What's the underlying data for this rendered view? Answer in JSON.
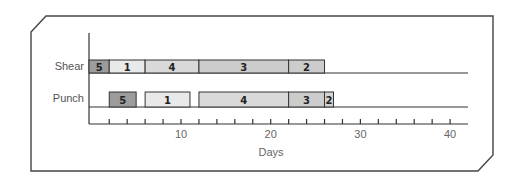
{
  "chart_data": {
    "type": "bar",
    "subtype": "gantt",
    "title": "",
    "xlabel": "Days",
    "ylabel": "",
    "xlim": [
      0,
      42
    ],
    "x_ticks_major": [
      10,
      20,
      30,
      40
    ],
    "x_tick_labels": [
      "10",
      "20",
      "30",
      "40"
    ],
    "x_minor_tick_step": 2,
    "grid": false,
    "legend": null,
    "categories": [
      "Shear",
      "Punch"
    ],
    "series": [
      {
        "name": "Shear",
        "segments": [
          {
            "label": "5",
            "start": 0,
            "end": 2,
            "color": "#9c9c9c"
          },
          {
            "label": "1",
            "start": 2,
            "end": 6,
            "color": "#e9e9e9"
          },
          {
            "label": "4",
            "start": 6,
            "end": 12,
            "color": "#d9d9d9"
          },
          {
            "label": "3",
            "start": 12,
            "end": 22,
            "color": "#cccccc"
          },
          {
            "label": "2",
            "start": 22,
            "end": 26,
            "color": "#cccccc"
          }
        ]
      },
      {
        "name": "Punch",
        "segments": [
          {
            "label": "5",
            "start": 2,
            "end": 5,
            "color": "#9c9c9c"
          },
          {
            "label": "1",
            "start": 6,
            "end": 11,
            "color": "#e9e9e9"
          },
          {
            "label": "4",
            "start": 12,
            "end": 22,
            "color": "#d9d9d9"
          },
          {
            "label": "3",
            "start": 22,
            "end": 26,
            "color": "#cccccc"
          },
          {
            "label": "2",
            "start": 26,
            "end": 27,
            "color": "#d4d4d4"
          }
        ]
      }
    ]
  },
  "labels": {
    "row_shear": "Shear",
    "row_punch": "Punch",
    "x_axis_title": "Days"
  },
  "colors": {
    "frame": "#444444",
    "axis": "#333333",
    "bar_border": "#333333"
  }
}
